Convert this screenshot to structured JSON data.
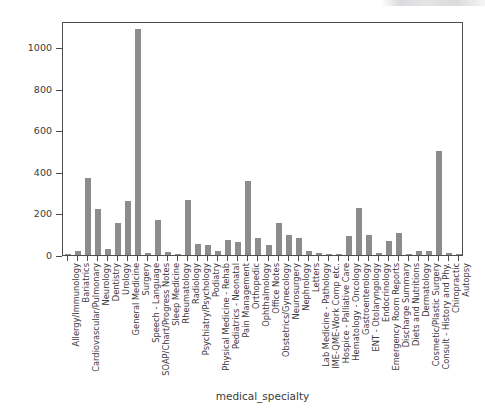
{
  "chart_data": {
    "type": "bar",
    "title": "",
    "xlabel": "medical_specialty",
    "ylabel": "count",
    "ylim": [
      0,
      1125
    ],
    "yticks": [
      0,
      200,
      400,
      600,
      800,
      1000
    ],
    "ytick_labels": [
      "0",
      "200",
      "400",
      "600",
      "800",
      "1000"
    ],
    "grid": false,
    "legend": null,
    "bar_color": "#8c8c8c",
    "axis_color": "#4c4c50",
    "text_color": "#3b3b3b",
    "categories": [
      "Allergy/Immunology",
      "Bariatrics",
      "Cardiovascular/Pulmonary",
      "Neurology",
      "Dentistry",
      "Urology",
      "General Medicine",
      "Surgery",
      "Speech - Language",
      "SOAP/Chart/Progress Notes",
      "Sleep Medicine",
      "Rheumatology",
      "Radiology",
      "Psychiatry/Psychology",
      "Podiatry",
      "Physical Medicine - Rehab",
      "Pediatrics - Neonatal",
      "Pain Management",
      "Orthopedic",
      "Ophthalmology",
      "Office Notes",
      "Obstetrics/Gynecology",
      "Neurosurgery",
      "Nephrology",
      "Letters",
      "Lab Medicine - Pathology",
      "IME-QME-Work Comp etc.",
      "Hospice - Palliative Care",
      "Hematology - Oncology",
      "Gastroenterology",
      "ENT - Otolaryngology",
      "Endocrinology",
      "Emergency Room Reports",
      "Discharge Summary",
      "Diets and Nutritions",
      "Dermatology",
      "Cosmetic/Plastic Surgery",
      "Consult - History and Phy.",
      "Chiropractic",
      "Autopsy"
    ],
    "values": [
      7,
      18,
      371,
      223,
      27,
      156,
      259,
      1088,
      9,
      166,
      15,
      4,
      264,
      53,
      47,
      21,
      70,
      62,
      355,
      83,
      50,
      155,
      94,
      80,
      17,
      8,
      5,
      6,
      90,
      224,
      96,
      9,
      68,
      104,
      1,
      19,
      17,
      499,
      8,
      3
    ]
  }
}
